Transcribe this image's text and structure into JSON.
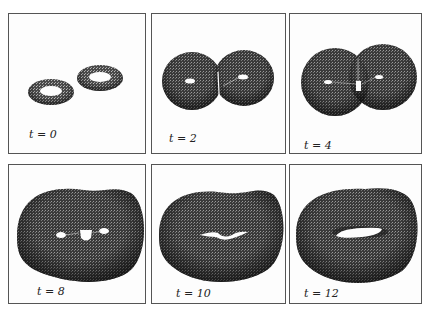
{
  "figure": {
    "panels": [
      {
        "id": "p1",
        "label": "t = 0",
        "time": 0
      },
      {
        "id": "p2",
        "label": "t = 2",
        "time": 2
      },
      {
        "id": "p3",
        "label": "t = 4",
        "time": 4
      },
      {
        "id": "p4",
        "label": "t = 8",
        "time": 8
      },
      {
        "id": "p5",
        "label": "t = 10",
        "time": 10
      },
      {
        "id": "p6",
        "label": "t = 12",
        "time": 12
      }
    ],
    "colors": {
      "border": "#555555",
      "surface_dark": "#2a2a2a",
      "surface_mid": "#555555",
      "background": "#fdfdfd"
    }
  }
}
